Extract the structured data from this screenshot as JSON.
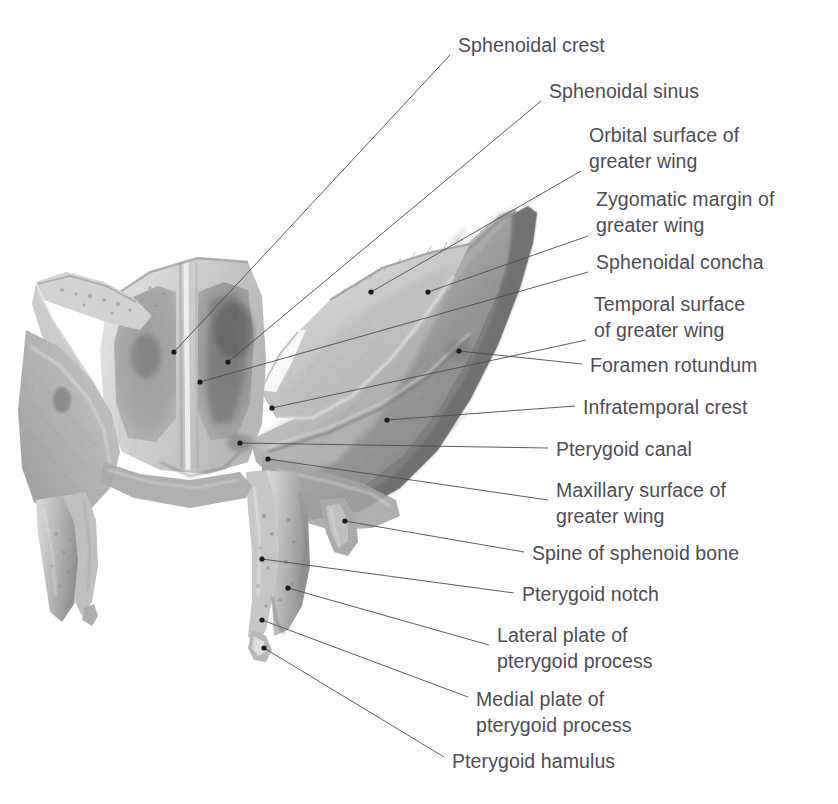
{
  "figure": {
    "subject": "Sphenoid bone",
    "view": "anterior view",
    "width": 838,
    "height": 804,
    "background_color": "#ffffff",
    "label_text_color": "#4c4c55",
    "leader_line_color": "#4a4a52",
    "marker_color": "#1a1a1a",
    "illustration_tone": "grayscale pencil / halftone rendering"
  },
  "labels": [
    {
      "id": "sphenoidal-crest",
      "text": "Sphenoidal crest",
      "x": 458,
      "y": 32,
      "leader": {
        "x1": 450,
        "y1": 55,
        "x2": 174,
        "y2": 352
      },
      "marker": {
        "x": 174,
        "y": 352
      }
    },
    {
      "id": "sphenoidal-sinus",
      "text": "Sphenoidal sinus",
      "x": 549,
      "y": 78,
      "leader": {
        "x1": 541,
        "y1": 101,
        "x2": 228,
        "y2": 362
      },
      "marker": {
        "x": 228,
        "y": 362
      }
    },
    {
      "id": "orbital-surface-of-greater-wing",
      "text": "Orbital surface of\ngreater wing",
      "x": 589,
      "y": 122,
      "leader": {
        "x1": 581,
        "y1": 171,
        "x2": 371,
        "y2": 292
      },
      "marker": {
        "x": 371,
        "y": 292
      }
    },
    {
      "id": "zygomatic-margin-of-greater-wing",
      "text": "Zygomatic margin of\ngreater wing",
      "x": 596,
      "y": 186,
      "leader": {
        "x1": 588,
        "y1": 236,
        "x2": 428,
        "y2": 292
      },
      "marker": {
        "x": 428,
        "y": 292
      }
    },
    {
      "id": "sphenoidal-concha",
      "text": "Sphenoidal concha",
      "x": 596,
      "y": 249,
      "leader": {
        "x1": 588,
        "y1": 272,
        "x2": 200,
        "y2": 382
      },
      "marker": {
        "x": 200,
        "y": 382
      }
    },
    {
      "id": "temporal-surface-of-greater-wing",
      "text": "Temporal surface\nof greater wing",
      "x": 594,
      "y": 291,
      "leader": {
        "x1": 586,
        "y1": 340,
        "x2": 272,
        "y2": 408
      },
      "marker": {
        "x": 272,
        "y": 408
      }
    },
    {
      "id": "foramen-rotundum",
      "text": "Foramen rotundum",
      "x": 590,
      "y": 352,
      "leader": {
        "x1": 582,
        "y1": 364,
        "x2": 459,
        "y2": 351
      },
      "marker": {
        "x": 459,
        "y": 351
      }
    },
    {
      "id": "infratemporal-crest",
      "text": "Infratemporal crest",
      "x": 583,
      "y": 394,
      "leader": {
        "x1": 575,
        "y1": 406,
        "x2": 387,
        "y2": 420
      },
      "marker": {
        "x": 387,
        "y": 420
      }
    },
    {
      "id": "pterygoid-canal",
      "text": "Pterygoid canal",
      "x": 556,
      "y": 436,
      "leader": {
        "x1": 548,
        "y1": 448,
        "x2": 240,
        "y2": 443
      },
      "marker": {
        "x": 240,
        "y": 443
      }
    },
    {
      "id": "maxillary-surface-of-greater-wing",
      "text": "Maxillary surface of\ngreater wing",
      "x": 556,
      "y": 477,
      "leader": {
        "x1": 548,
        "y1": 500,
        "x2": 268,
        "y2": 459
      },
      "marker": {
        "x": 268,
        "y": 459
      }
    },
    {
      "id": "spine-of-sphenoid-bone",
      "text": "Spine of sphenoid bone",
      "x": 532,
      "y": 540,
      "leader": {
        "x1": 524,
        "y1": 552,
        "x2": 345,
        "y2": 521
      },
      "marker": {
        "x": 345,
        "y": 521
      }
    },
    {
      "id": "pterygoid-notch",
      "text": "Pterygoid notch",
      "x": 522,
      "y": 581,
      "leader": {
        "x1": 514,
        "y1": 593,
        "x2": 262,
        "y2": 559
      },
      "marker": {
        "x": 262,
        "y": 559
      }
    },
    {
      "id": "lateral-plate-of-pterygoid-process",
      "text": "Lateral plate of\npterygoid process",
      "x": 497,
      "y": 622,
      "leader": {
        "x1": 489,
        "y1": 645,
        "x2": 288,
        "y2": 588
      },
      "marker": {
        "x": 288,
        "y": 588
      }
    },
    {
      "id": "medial-plate-of-pterygoid-process",
      "text": "Medial plate of\npterygoid process",
      "x": 476,
      "y": 686,
      "leader": {
        "x1": 468,
        "y1": 697,
        "x2": 262,
        "y2": 620
      },
      "marker": {
        "x": 262,
        "y": 620
      }
    },
    {
      "id": "pterygoid-hamulus",
      "text": "Pterygoid hamulus",
      "x": 452,
      "y": 748,
      "leader": {
        "x1": 444,
        "y1": 757,
        "x2": 264,
        "y2": 648
      },
      "marker": {
        "x": 264,
        "y": 648
      }
    }
  ]
}
